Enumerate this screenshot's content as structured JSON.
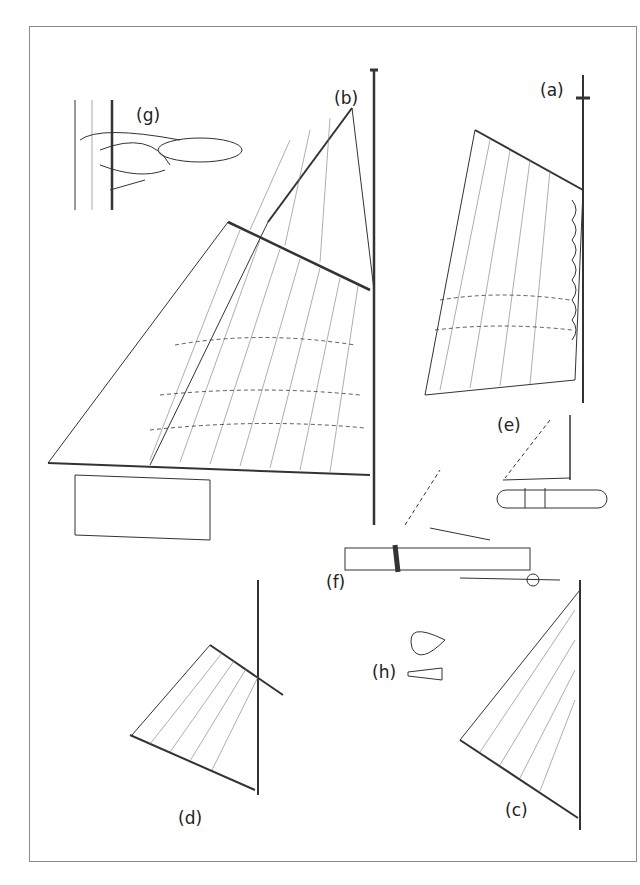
{
  "figure": {
    "labels": {
      "a": "(a)",
      "b": "(b)",
      "c": "(c)",
      "d": "(d)",
      "e": "(e)",
      "f": "(f)",
      "g": "(g)",
      "h": "(h)"
    },
    "colors": {
      "line": "#333333",
      "frame": "#8a8a8a",
      "background": "#ffffff"
    }
  }
}
